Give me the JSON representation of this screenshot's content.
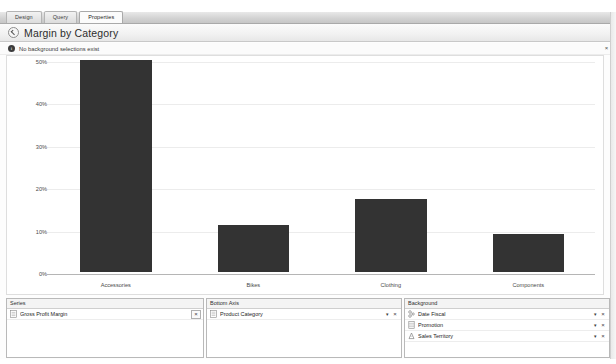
{
  "tabs": [
    {
      "label": "Design",
      "active": false
    },
    {
      "label": "Query",
      "active": false
    },
    {
      "label": "Properties",
      "active": true
    }
  ],
  "titlebar": {
    "back_icon": "back-arrow-circle-icon",
    "title": "Margin by Category"
  },
  "infobar": {
    "icon": "info-icon",
    "glyph": "i",
    "message": "No background selections exist",
    "close_glyph": "×"
  },
  "chart_data": {
    "type": "bar",
    "title": "Margin by Category",
    "categories": [
      "Accessories",
      "Bikes",
      "Clothing",
      "Components"
    ],
    "values": [
      50.0,
      11.0,
      17.3,
      9.0
    ],
    "series": [
      {
        "name": "Gross Profit Margin",
        "values": [
          50.0,
          11.0,
          17.3,
          9.0
        ]
      }
    ],
    "xlabel": "Product Category",
    "ylabel": "",
    "ylim": [
      0,
      50
    ],
    "ytick_values": [
      0,
      10,
      20,
      30,
      40,
      50
    ],
    "ytick_labels": [
      "0%",
      "10%",
      "20%",
      "30%",
      "40%",
      "50%"
    ],
    "grid": true,
    "legend": "none",
    "bar_color": "#333333",
    "value_suffix": "%"
  },
  "panels": {
    "series": {
      "header": "Series",
      "rows": [
        {
          "icon": "measure-icon",
          "label": "Gross Profit Margin",
          "caret": "",
          "close": "×"
        }
      ]
    },
    "bottom_axis": {
      "header": "Bottom Axis",
      "rows": [
        {
          "icon": "hierarchy-icon",
          "label": "Product Category",
          "caret": "▾",
          "close": "×"
        }
      ]
    },
    "background": {
      "header": "Background",
      "rows": [
        {
          "icon": "date-hierarchy-icon",
          "label": "Date Fiscal",
          "caret": "▾",
          "close": "×"
        },
        {
          "icon": "table-icon",
          "label": "Promotion",
          "caret": "▾",
          "close": "×"
        },
        {
          "icon": "geo-hierarchy-icon",
          "label": "Sales Territory",
          "caret": "▾",
          "close": "×"
        }
      ]
    }
  }
}
